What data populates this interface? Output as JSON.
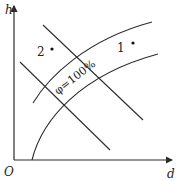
{
  "diagram": {
    "type": "h-d psychrometric diagram",
    "axes": {
      "y_label": "h",
      "x_label": "d",
      "origin_label": "O"
    },
    "curve_label": "φ=100%",
    "points": [
      {
        "id": "1",
        "label": "1"
      },
      {
        "id": "2",
        "label": "2"
      }
    ],
    "colors": {
      "line": "#2b2b2b",
      "background": "#ffffff"
    }
  }
}
